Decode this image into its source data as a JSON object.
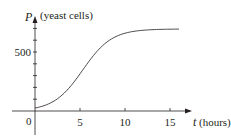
{
  "chart_data": {
    "type": "line",
    "title": "",
    "xlabel": "t (hours)",
    "ylabel": "P (yeast cells)",
    "x_axis_var": "t",
    "x_axis_unit": "(hours)",
    "y_axis_var": "P",
    "y_axis_unit": "(yeast cells)",
    "origin_label": "0",
    "x_ticks": [
      5,
      10,
      15
    ],
    "x_tick_labels": [
      "5",
      "10",
      "15"
    ],
    "y_ticks": [
      100,
      200,
      300,
      400,
      500,
      600,
      700
    ],
    "y_tick_labels": [
      "",
      "",
      "",
      "",
      "500",
      "",
      ""
    ],
    "xlim": [
      0,
      16
    ],
    "ylim": [
      0,
      700
    ],
    "grid": false,
    "legend": null,
    "series": [
      {
        "name": "P(t)",
        "x": [
          0,
          1,
          2,
          3,
          4,
          5,
          6,
          7,
          8,
          9,
          10,
          11,
          12,
          13,
          14,
          15,
          16
        ],
        "values": [
          25,
          45,
          75,
          120,
          180,
          260,
          350,
          440,
          520,
          590,
          630,
          655,
          672,
          682,
          688,
          692,
          694
        ]
      }
    ]
  }
}
